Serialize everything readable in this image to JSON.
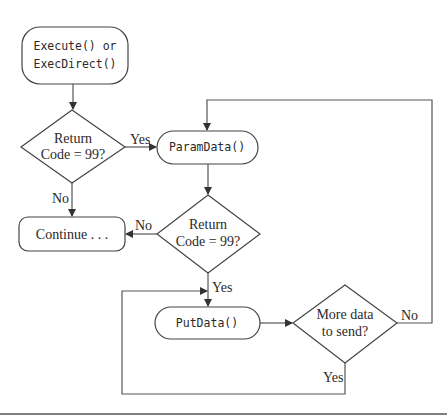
{
  "diagram": {
    "type": "flowchart",
    "nodes": {
      "start": {
        "line1": "Execute() or",
        "line2": "ExecDirect()"
      },
      "decision1": {
        "line1": "Return",
        "line2": "Code = 99?"
      },
      "paramdata": {
        "label": "ParamData()"
      },
      "continue": {
        "label": "Continue . . ."
      },
      "decision2": {
        "line1": "Return",
        "line2": "Code = 99?"
      },
      "putdata": {
        "label": "PutData()"
      },
      "decision3": {
        "line1": "More data",
        "line2": "to send?"
      }
    },
    "edges": {
      "d1_yes": "Yes",
      "d1_no": "No",
      "d2_no": "No",
      "d2_yes": "Yes",
      "d3_no": "No",
      "d3_yes": "Yes"
    }
  }
}
